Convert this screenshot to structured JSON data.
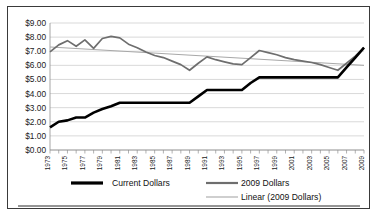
{
  "chart_data": {
    "type": "line",
    "title": "",
    "subtitle": "",
    "xlabel": "",
    "ylabel": "",
    "grid": true,
    "legend_position": "bottom",
    "xlim": [
      1973,
      2009
    ],
    "ylim": [
      0,
      9
    ],
    "y_ticks": [
      0,
      1,
      2,
      3,
      4,
      5,
      6,
      7,
      8,
      9
    ],
    "y_tick_labels": [
      "$0.00",
      "$1.00",
      "$2.00",
      "$3.00",
      "$4.00",
      "$5.00",
      "$6.00",
      "$7.00",
      "$8.00",
      "$9.00"
    ],
    "x": [
      1973,
      1974,
      1975,
      1976,
      1977,
      1978,
      1979,
      1980,
      1981,
      1982,
      1983,
      1984,
      1985,
      1986,
      1987,
      1988,
      1989,
      1990,
      1991,
      1992,
      1993,
      1994,
      1995,
      1996,
      1997,
      1998,
      1999,
      2000,
      2001,
      2002,
      2003,
      2004,
      2005,
      2006,
      2007,
      2008,
      2009
    ],
    "x_tick_labels": [
      "1973",
      "1975",
      "1977",
      "1979",
      "1981",
      "1983",
      "1985",
      "1987",
      "1989",
      "1991",
      "1993",
      "1995",
      "1997",
      "1999",
      "2001",
      "2003",
      "2005",
      "2007",
      "2009"
    ],
    "series": [
      {
        "name": "Current Dollars",
        "color": "#000000",
        "style": "thick-solid",
        "values": [
          1.6,
          2.0,
          2.1,
          2.3,
          2.3,
          2.65,
          2.9,
          3.1,
          3.35,
          3.35,
          3.35,
          3.35,
          3.35,
          3.35,
          3.35,
          3.35,
          3.35,
          3.8,
          4.25,
          4.25,
          4.25,
          4.25,
          4.25,
          4.75,
          5.15,
          5.15,
          5.15,
          5.15,
          5.15,
          5.15,
          5.15,
          5.15,
          5.15,
          5.15,
          5.85,
          6.55,
          7.25
        ]
      },
      {
        "name": "2009 Dollars",
        "color": "#6e6e6e",
        "style": "medium-solid",
        "values": [
          6.95,
          7.45,
          7.75,
          7.35,
          7.8,
          7.2,
          7.9,
          8.05,
          7.95,
          7.5,
          7.25,
          6.95,
          6.7,
          6.55,
          6.3,
          6.05,
          5.65,
          6.15,
          6.6,
          6.4,
          6.25,
          6.1,
          6.05,
          6.55,
          7.05,
          6.9,
          6.75,
          6.55,
          6.4,
          6.3,
          6.2,
          6.05,
          5.85,
          5.65,
          6.15,
          6.65,
          7.25
        ]
      }
    ],
    "trendline": {
      "name": "Linear (2009 Dollars)",
      "color": "#a8a8a8",
      "style": "thin-solid",
      "x_start": 1973,
      "y_start": 7.3,
      "x_end": 2009,
      "y_end": 6.0
    },
    "legend": [
      {
        "label": "Current Dollars",
        "color": "#000000",
        "width": 3.2
      },
      {
        "label": "2009 Dollars",
        "color": "#6e6e6e",
        "width": 2.2
      },
      {
        "label": "Linear (2009 Dollars)",
        "color": "#a8a8a8",
        "width": 1.1
      }
    ]
  }
}
